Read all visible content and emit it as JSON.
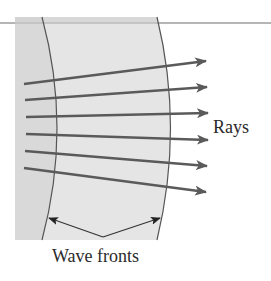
{
  "figure": {
    "labels": {
      "rays": "Rays",
      "wave_fronts": "Wave fronts"
    },
    "colors": {
      "outer_medium": "#d9d9d9",
      "inner_medium": "#e5e5e5",
      "horizon_line": "#b5b5b5",
      "wavefront_stroke": "#555555",
      "ray_color": "#5a5a5a",
      "text": "#2a2a2a"
    },
    "rays": [
      {
        "x1": 24,
        "y1": 84,
        "x2": 206,
        "y2": 61
      },
      {
        "x1": 25,
        "y1": 100,
        "x2": 207,
        "y2": 87
      },
      {
        "x1": 26,
        "y1": 117,
        "x2": 208,
        "y2": 113
      },
      {
        "x1": 26,
        "y1": 134,
        "x2": 208,
        "y2": 140
      },
      {
        "x1": 25,
        "y1": 151,
        "x2": 207,
        "y2": 166
      },
      {
        "x1": 24,
        "y1": 168,
        "x2": 206,
        "y2": 192
      }
    ],
    "wavefronts": [
      {
        "top_x": 42,
        "mid_x": 57,
        "bottom_x": 42
      },
      {
        "top_x": 157,
        "mid_x": 170,
        "bottom_x": 157
      }
    ],
    "pointer": {
      "vertex": [
        103,
        237
      ],
      "left_tip": [
        49,
        218
      ],
      "right_tip": [
        160,
        218
      ]
    }
  }
}
